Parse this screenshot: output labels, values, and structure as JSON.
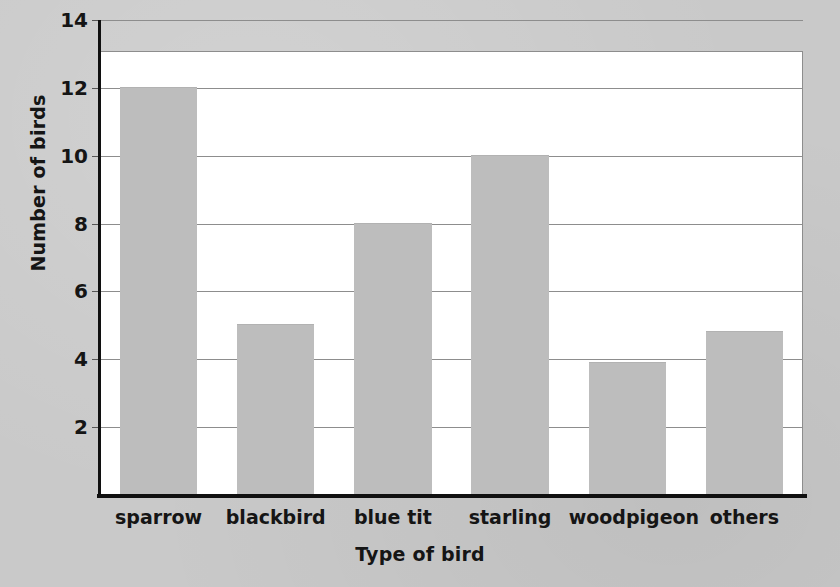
{
  "chart_data": {
    "type": "bar",
    "title": "",
    "subtitle": "",
    "xlabel": "Type of bird",
    "ylabel": "Number of birds",
    "categories": [
      "sparrow",
      "blackbird",
      "blue tit",
      "starling",
      "woodpigeon",
      "others"
    ],
    "values": [
      12,
      5,
      8,
      10,
      3.9,
      4.8
    ],
    "ylim": [
      0,
      14
    ],
    "ytick_labels": [
      "2",
      "4",
      "6",
      "8",
      "10",
      "12",
      "14"
    ],
    "ytick_values": [
      2,
      4,
      6,
      8,
      10,
      12,
      14
    ],
    "grid": "horizontal",
    "legend": "none",
    "bar_color": "#bdbdbd",
    "axis_color": "#101010",
    "gridline_color": "#8d8d8d",
    "plot_background": "#ffffff",
    "page_background": "#c9c9c9"
  },
  "axes": {
    "y_title": "Number of birds",
    "x_title": "Type of bird"
  },
  "bars": [
    {
      "label": "sparrow",
      "value": 12
    },
    {
      "label": "blackbird",
      "value": 5
    },
    {
      "label": "blue tit",
      "value": 8
    },
    {
      "label": "starling",
      "value": 10
    },
    {
      "label": "woodpigeon",
      "value": 3.9
    },
    {
      "label": "others",
      "value": 4.8
    }
  ],
  "yticks": [
    {
      "label": "14",
      "value": 14
    },
    {
      "label": "12",
      "value": 12
    },
    {
      "label": "10",
      "value": 10
    },
    {
      "label": "8",
      "value": 8
    },
    {
      "label": "6",
      "value": 6
    },
    {
      "label": "4",
      "value": 4
    },
    {
      "label": "2",
      "value": 2
    }
  ]
}
